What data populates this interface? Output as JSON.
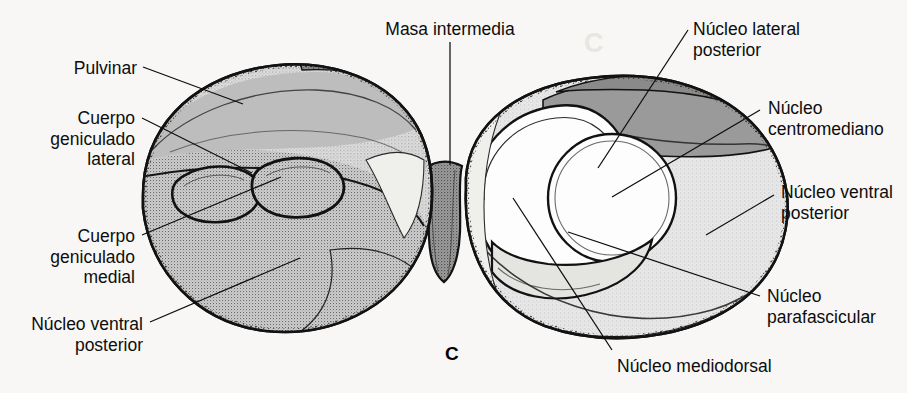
{
  "figure": {
    "panel_letter": "C",
    "background_color": "#f8f7f5",
    "ink_color": "#0d0d0d",
    "width": 907,
    "height": 393
  },
  "palette": {
    "outline": "#121212",
    "fill_white": "#fdfdfd",
    "fill_light_grey": "#d6d6d6",
    "fill_mid_grey": "#b9b9b9",
    "fill_dark_grey": "#9a9a9a",
    "fill_darker_grey": "#8a8a8a",
    "stipple": "#4a4a4a"
  },
  "labels": {
    "pulvinar": {
      "text": "Pulvinar",
      "lines": [
        "Pulvinar"
      ],
      "align": "right",
      "x": 137,
      "y": 60
    },
    "cuerpo_geniculado_lateral": {
      "text": "Cuerpo geniculado lateral",
      "lines": [
        "Cuerpo",
        "geniculado",
        "lateral"
      ],
      "align": "right",
      "x": 135,
      "y": 110
    },
    "cuerpo_geniculado_medial": {
      "text": "Cuerpo geniculado medial",
      "lines": [
        "Cuerpo",
        "geniculado",
        "medial"
      ],
      "align": "right",
      "x": 135,
      "y": 228
    },
    "nucleo_ventral_posterior_izq": {
      "text": "Núcleo ventral posterior",
      "lines": [
        "Núcleo ventral",
        "posterior"
      ],
      "align": "right",
      "x": 143,
      "y": 317
    },
    "masa_intermedia": {
      "text": "Masa intermedia",
      "lines": [
        "Masa intermedia"
      ],
      "align": "center",
      "x": 450,
      "y": 21
    },
    "nucleo_lateral_posterior": {
      "text": "Núcleo lateral posterior",
      "lines": [
        "Núcleo lateral",
        "posterior"
      ],
      "align": "left",
      "x": 693,
      "y": 21
    },
    "nucleo_centromediano": {
      "text": "Núcleo centromediano",
      "lines": [
        "Núcleo",
        "centromediano"
      ],
      "align": "left",
      "x": 768,
      "y": 100
    },
    "nucleo_ventral_posterior_der": {
      "text": "Núcleo ventral posterior",
      "lines": [
        "Núcleo ventral",
        "posterior"
      ],
      "align": "left",
      "x": 781,
      "y": 184
    },
    "nucleo_parafascicular": {
      "text": "Núcleo parafascicular",
      "lines": [
        "Núcleo",
        "parafascicular"
      ],
      "align": "left",
      "x": 767,
      "y": 288
    },
    "nucleo_mediodorsal": {
      "text": "Núcleo mediodorsal",
      "lines": [
        "Núcleo mediodorsal"
      ],
      "align": "left",
      "x": 617,
      "y": 358
    }
  },
  "leader_lines": {
    "pulvinar": "M143,67 L243,104",
    "cuerpo_geniculado_lateral": "M142,118 L252,173",
    "cuerpo_geniculado_medial": "M142,235 L281,177",
    "nucleo_ventral_posterior_izq": "M150,322 L300,258",
    "masa_intermedia": "M450,42 L450,165",
    "nucleo_lateral_posterior": "M688,30 L598,168",
    "nucleo_centromediano": "M760,110 L612,197",
    "nucleo_ventral_posterior_der": "M774,195 L706,235",
    "nucleo_parafascicular": "M760,296 L568,232",
    "nucleo_mediodorsal": "M612,350 L513,198"
  },
  "bleed_text": [
    {
      "text": "C",
      "x": 600,
      "y": 42
    },
    {
      "text": "Cuerpo",
      "x": 80,
      "y": 122
    }
  ]
}
